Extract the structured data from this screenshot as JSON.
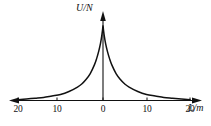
{
  "figure": {
    "background_color": "#ffffff",
    "ink_color": "#111111",
    "y_axis_title": "U/N",
    "x_axis_title": "L/m"
  },
  "chart_data": {
    "type": "line",
    "title": "",
    "xlabel": "L/m",
    "ylabel": "U/N",
    "xlim": [
      -22,
      22
    ],
    "ylim": [
      0,
      1.05
    ],
    "grid": false,
    "legend": null,
    "x_ticks": [
      -20,
      -10,
      0,
      10,
      20
    ],
    "x_tick_labels": [
      "20",
      "10",
      "0",
      "10",
      "20"
    ],
    "y_ticks": [],
    "y_tick_labels": [],
    "annotations": [],
    "series": [
      {
        "name": "U(L)",
        "x": [
          -20,
          -18,
          -16,
          -14,
          -12,
          -10,
          -8,
          -6,
          -5,
          -4,
          -3,
          -2,
          -1.5,
          -1,
          -0.6,
          -0.3,
          -0.1,
          0,
          0.1,
          0.3,
          0.6,
          1,
          1.5,
          2,
          3,
          4,
          5,
          6,
          8,
          10,
          12,
          14,
          16,
          18,
          20
        ],
        "y": [
          0.01,
          0.02,
          0.03,
          0.04,
          0.06,
          0.08,
          0.12,
          0.18,
          0.22,
          0.28,
          0.36,
          0.48,
          0.56,
          0.66,
          0.76,
          0.86,
          0.95,
          1.0,
          0.95,
          0.86,
          0.76,
          0.66,
          0.56,
          0.48,
          0.36,
          0.28,
          0.22,
          0.18,
          0.12,
          0.08,
          0.06,
          0.04,
          0.03,
          0.02,
          0.01
        ]
      }
    ]
  },
  "tick_labels": [
    {
      "text": "20",
      "x_px": 18
    },
    {
      "text": "10",
      "x_px": 57
    },
    {
      "text": "0",
      "x_px": 103
    },
    {
      "text": "10",
      "x_px": 147
    },
    {
      "text": "20",
      "x_px": 190
    }
  ]
}
